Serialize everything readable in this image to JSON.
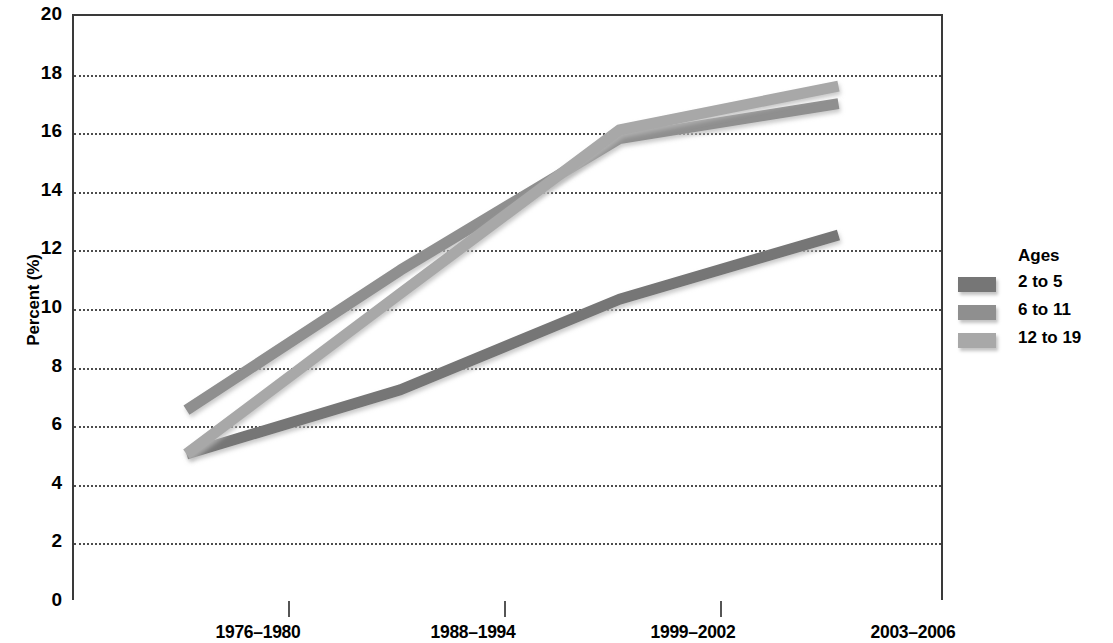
{
  "chart_data": {
    "type": "line",
    "title": "",
    "xlabel": "",
    "ylabel": "Percent (%)",
    "categories": [
      "1976–1980",
      "1988–1994",
      "1999–2002",
      "2003–2006"
    ],
    "series": [
      {
        "name": "2 to 5",
        "values": [
          5.0,
          7.2,
          10.3,
          12.5
        ],
        "color": "#767676"
      },
      {
        "name": "6 to 11",
        "values": [
          6.5,
          11.3,
          15.8,
          17.0
        ],
        "color": "#8f8f8f"
      },
      {
        "name": "12 to 19",
        "values": [
          5.0,
          10.5,
          16.1,
          17.6
        ],
        "color": "#a8a8a8"
      }
    ],
    "ylim": [
      0,
      20
    ],
    "ytick_step": 2,
    "ytick_labels": [
      "20",
      "18",
      "16",
      "14",
      "12",
      "10",
      "8",
      "6",
      "4",
      "2",
      "0"
    ],
    "grid": true,
    "grid_style": "dotted",
    "legend_position": "right"
  },
  "legend": {
    "title": "Ages",
    "entries": [
      {
        "label": "2 to 5",
        "color": "#767676"
      },
      {
        "label": "6 to 11",
        "color": "#8f8f8f"
      },
      {
        "label": "12 to 19",
        "color": "#a8a8a8"
      }
    ]
  },
  "axis": {
    "y_title": "Percent (%)"
  }
}
